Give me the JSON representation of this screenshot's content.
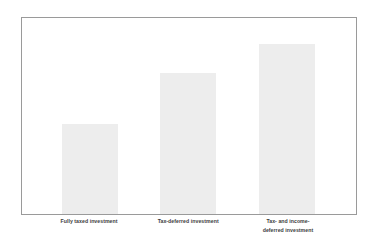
{
  "chart_data": {
    "type": "bar",
    "title": "",
    "subtitle": "",
    "xlabel": "",
    "ylabel": "",
    "grid": false,
    "legend": "none",
    "axis_ticks": [],
    "ylim": [
      0,
      100
    ],
    "categories": [
      "Fully taxed investment",
      "Tax-deferred investment",
      "Tax- and income-\ndeferred investment"
    ],
    "values": [
      46,
      72,
      87
    ],
    "series": [
      {
        "name": "Investment value",
        "values": [
          46,
          72,
          87
        ]
      }
    ],
    "bar_color": "#ededed",
    "frame_color": "#9a9a9a",
    "label_color": "#3c3c3c",
    "background_color": "#ffffff",
    "bars": [
      {
        "label": "Fully taxed investment",
        "value": 46,
        "left_pct": 11.9,
        "width_pct": 16.7,
        "height_pct": 46.0
      },
      {
        "label": "Tax-deferred investment",
        "value": 72,
        "left_pct": 41.4,
        "width_pct": 16.7,
        "height_pct": 71.7
      },
      {
        "label": "Tax- and income-\ndeferred investment",
        "value": 87,
        "left_pct": 71.1,
        "width_pct": 16.7,
        "height_pct": 86.9
      }
    ]
  }
}
